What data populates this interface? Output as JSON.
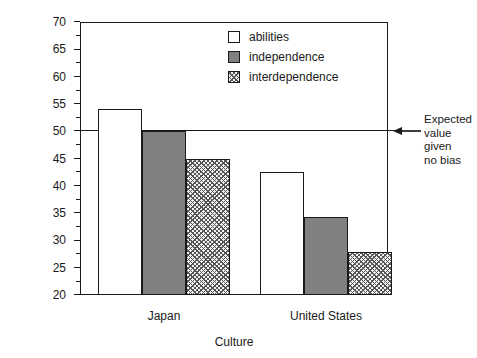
{
  "chart_data": {
    "type": "bar",
    "title": "",
    "xlabel": "Culture",
    "ylabel": "Percent estimate",
    "categories": [
      "Japan",
      "United States"
    ],
    "series": [
      {
        "name": "abilities",
        "fill": "open",
        "values": [
          54.0,
          42.5
        ]
      },
      {
        "name": "independence",
        "fill": "solid",
        "values": [
          50.0,
          34.3
        ]
      },
      {
        "name": "interdependence",
        "fill": "hatch",
        "values": [
          45.0,
          27.8
        ]
      }
    ],
    "ylim": [
      20,
      70
    ],
    "ytick_step": 5,
    "yticks": [
      20,
      25,
      30,
      35,
      40,
      45,
      50,
      55,
      60,
      65,
      70
    ],
    "ytick_labels": [
      "20",
      "25",
      "30",
      "35",
      "40",
      "45",
      "50",
      "55",
      "60",
      "65",
      "70"
    ],
    "minor_ticks": true,
    "grid": false,
    "legend_position": "top-center",
    "reference_line": {
      "value": 50,
      "label": "Expected\nvalue\ngiven\nno bias",
      "arrow": "left-arrow-icon"
    },
    "colors": {
      "axis": "#1a1a1a",
      "open_fill": "#ffffff",
      "solid_fill": "#808080",
      "hatch_fill": "#f2f2f2",
      "background": "#ffffff"
    }
  }
}
